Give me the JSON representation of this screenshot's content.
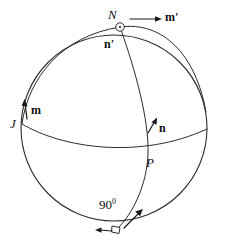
{
  "figure": {
    "background_color": "#ffffff",
    "stroke_color": "#2b2b2b",
    "labels": {
      "north_pole": "N",
      "m_prime": "m",
      "m_prime_mark": "′",
      "n_prime": "n",
      "n_prime_mark": "′",
      "m_vector": "m",
      "j_point": "J",
      "n_vector": "n",
      "p_point": "P",
      "angle": "90",
      "angle_unit": "0"
    },
    "geometry": {
      "sphere_center_x": 114,
      "sphere_center_y": 128,
      "sphere_radius": 93,
      "equator_left_x": 22,
      "equator_left_y": 124,
      "equator_right_x": 207,
      "equator_right_y": 129,
      "north_pole_x": 120,
      "north_pole_y": 27,
      "p_point_x": 148,
      "p_point_y": 154,
      "bottom_point_x": 117,
      "bottom_point_y": 229
    }
  }
}
